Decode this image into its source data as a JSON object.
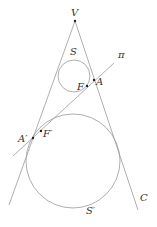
{
  "diagram": {
    "labels": {
      "vertex": "V",
      "small_sphere": "S",
      "large_sphere": "S′",
      "plane": "π",
      "point_a": "A",
      "point_f": "F",
      "point_a_prime": "A′",
      "point_f_prime": "F′",
      "cone": "C"
    },
    "colors": {
      "stroke": "#9a9a9a",
      "point": "#222222",
      "text": "#333333"
    }
  }
}
